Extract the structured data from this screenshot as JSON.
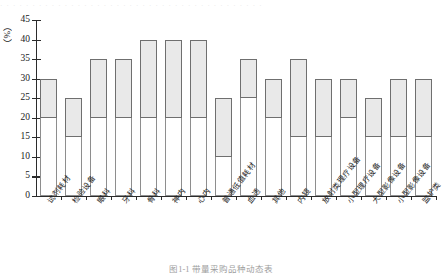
{
  "top_strip": {
    "text": "· · · · · · · · · · · · · · · · · · · · · · · · · · · · · · · · · · · · · · · · ·"
  },
  "caption": {
    "text": "图1-1  带量采购品种动态表"
  },
  "chart_data": {
    "type": "bar",
    "subtype": "floating-range-bar",
    "title": "",
    "xlabel": "",
    "ylabel": "",
    "unit_label": "（%）",
    "ylim": [
      0,
      45
    ],
    "ytick_step": 5,
    "yticks": [
      0,
      5,
      10,
      15,
      20,
      25,
      30,
      35,
      40,
      45
    ],
    "ytick_labels": [
      "0",
      "5",
      "10",
      "15",
      "20",
      "25",
      "30",
      "35",
      "40",
      "45"
    ],
    "grid": false,
    "legend": "none",
    "colors": {
      "bar_fill": "#e9e9e9",
      "bar_border": "#6f6f6f",
      "base_fill": "#ffffff",
      "base_border": "#8e8e8e",
      "axis": "#2b2b2b"
    },
    "categories": [
      "试剂耗材",
      "检验设备",
      "眼科",
      "牙科",
      "骨科",
      "神内",
      "心内",
      "普通低值耗材",
      "血透",
      "其他",
      "内镜",
      "放射类理疗设备",
      "小型理疗设备",
      "大型影像设备",
      "小型影像设备",
      "监护类"
    ],
    "series": [
      {
        "name": "区间下限",
        "values": [
          20,
          15,
          20,
          20,
          20,
          20,
          20,
          10,
          25,
          20,
          15,
          15,
          20,
          15,
          15,
          15
        ]
      },
      {
        "name": "区间上限",
        "values": [
          30,
          25,
          35,
          35,
          40,
          40,
          40,
          25,
          35,
          30,
          35,
          30,
          30,
          25,
          30,
          30
        ]
      }
    ],
    "ranges": [
      {
        "category": "试剂耗材",
        "low": 20,
        "high": 30
      },
      {
        "category": "检验设备",
        "low": 15,
        "high": 25
      },
      {
        "category": "眼科",
        "low": 20,
        "high": 35
      },
      {
        "category": "牙科",
        "low": 20,
        "high": 35
      },
      {
        "category": "骨科",
        "low": 20,
        "high": 40
      },
      {
        "category": "神内",
        "low": 20,
        "high": 40
      },
      {
        "category": "心内",
        "low": 20,
        "high": 40
      },
      {
        "category": "普通低值耗材",
        "low": 10,
        "high": 25
      },
      {
        "category": "血透",
        "low": 25,
        "high": 35
      },
      {
        "category": "其他",
        "low": 20,
        "high": 30
      },
      {
        "category": "内镜",
        "low": 15,
        "high": 35
      },
      {
        "category": "放射类理疗设备",
        "low": 15,
        "high": 30
      },
      {
        "category": "小型理疗设备",
        "low": 20,
        "high": 30
      },
      {
        "category": "大型影像设备",
        "low": 15,
        "high": 25
      },
      {
        "category": "小型影像设备",
        "low": 15,
        "high": 30
      },
      {
        "category": "监护类",
        "low": 15,
        "high": 30
      }
    ]
  }
}
